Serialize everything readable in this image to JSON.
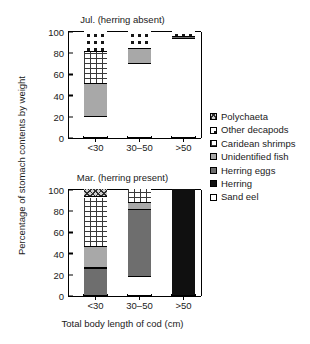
{
  "figure": {
    "ylabel": "Percentage of stomach contents by weight",
    "xlabel": "Total body length of cod (cm)"
  },
  "legend": {
    "items": [
      {
        "key": "polychaeta",
        "label": "Polychaeta",
        "pattern": "diagonal-crosshatch",
        "color": "#cfcfcf"
      },
      {
        "key": "decapods",
        "label": "Other decapods",
        "pattern": "polka-dots",
        "color": "#ffffff"
      },
      {
        "key": "caridean",
        "label": "Caridean shrimps",
        "pattern": "brick",
        "color": "#ffffff"
      },
      {
        "key": "unidfish",
        "label": "Unidentified fish",
        "pattern": "solid",
        "color": "#a8a8a8"
      },
      {
        "key": "herringeggs",
        "label": "Herring eggs",
        "pattern": "solid",
        "color": "#6e6e6e"
      },
      {
        "key": "herring",
        "label": "Herring",
        "pattern": "solid",
        "color": "#101010"
      },
      {
        "key": "sandeel",
        "label": "Sand eel",
        "pattern": "solid",
        "color": "#ffffff"
      }
    ]
  },
  "charts": {
    "jul": {
      "title": "Jul. (herring absent)",
      "ticks": [
        "100",
        "80",
        "60",
        "40",
        "20",
        "0"
      ],
      "categories": [
        "<30",
        "30–50",
        ">50"
      ]
    },
    "mar": {
      "title": "Mar. (herring present)",
      "ticks": [
        "100",
        "80",
        "60",
        "40",
        "20",
        "0"
      ],
      "categories": [
        "<30",
        "30–50",
        ">50"
      ]
    }
  },
  "chart_data": [
    {
      "id": "jul",
      "type": "bar",
      "stacked": true,
      "title": "Jul. (herring absent)",
      "xlabel": "Total body length of cod (cm)",
      "ylabel": "Percentage of stomach contents by weight",
      "ylim": [
        0,
        100
      ],
      "yticks": [
        0,
        20,
        40,
        60,
        80,
        100
      ],
      "grid": false,
      "legend_position": "right",
      "categories": [
        "<30",
        "30–50",
        ">50"
      ],
      "series": [
        {
          "name": "Sand eel",
          "values": [
            19,
            69,
            92
          ]
        },
        {
          "name": "Herring",
          "values": [
            0,
            0,
            0
          ]
        },
        {
          "name": "Herring eggs",
          "values": [
            0,
            0,
            2
          ]
        },
        {
          "name": "Unidentified fish",
          "values": [
            31,
            14,
            0
          ]
        },
        {
          "name": "Caridean shrimps",
          "values": [
            30,
            0,
            0
          ]
        },
        {
          "name": "Other decapods",
          "values": [
            20,
            17,
            6
          ]
        },
        {
          "name": "Polychaeta",
          "values": [
            0,
            0,
            0
          ]
        }
      ]
    },
    {
      "id": "mar",
      "type": "bar",
      "stacked": true,
      "title": "Mar. (herring present)",
      "xlabel": "Total body length of cod (cm)",
      "ylabel": "Percentage of stomach contents by weight",
      "ylim": [
        0,
        100
      ],
      "yticks": [
        0,
        20,
        40,
        60,
        80,
        100
      ],
      "grid": false,
      "legend_position": "right",
      "categories": [
        "<30",
        "30–50",
        ">50"
      ],
      "series": [
        {
          "name": "Sand eel",
          "values": [
            0,
            17,
            0
          ]
        },
        {
          "name": "Herring",
          "values": [
            0,
            0,
            100
          ]
        },
        {
          "name": "Herring eggs",
          "values": [
            25,
            63,
            0
          ]
        },
        {
          "name": "Unidentified fish",
          "values": [
            20,
            7,
            0
          ]
        },
        {
          "name": "Caridean shrimps",
          "values": [
            47,
            13,
            0
          ]
        },
        {
          "name": "Other decapods",
          "values": [
            0,
            0,
            0
          ]
        },
        {
          "name": "Polychaeta",
          "values": [
            8,
            0,
            0
          ]
        }
      ]
    }
  ]
}
